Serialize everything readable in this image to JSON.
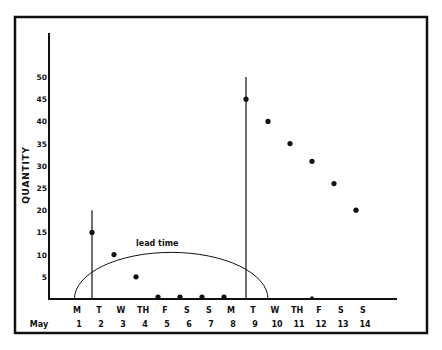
{
  "chart_data": {
    "type": "scatter",
    "title": "",
    "xlabel": "",
    "ylabel": "QUANTITY",
    "ylim": [
      0,
      50
    ],
    "yticks": [
      5,
      10,
      15,
      20,
      25,
      30,
      35,
      40,
      45,
      50
    ],
    "grid": false,
    "legend": null,
    "x_row_label": "May",
    "categories": [
      {
        "day": "M",
        "date": "1"
      },
      {
        "day": "T",
        "date": "2"
      },
      {
        "day": "W",
        "date": "3"
      },
      {
        "day": "TH",
        "date": "4"
      },
      {
        "day": "F",
        "date": "5"
      },
      {
        "day": "S",
        "date": "6"
      },
      {
        "day": "S",
        "date": "7"
      },
      {
        "day": "M",
        "date": "8"
      },
      {
        "day": "T",
        "date": "9"
      },
      {
        "day": "W",
        "date": "10"
      },
      {
        "day": "TH",
        "date": "11"
      },
      {
        "day": "F",
        "date": "12"
      },
      {
        "day": "S",
        "date": "13"
      },
      {
        "day": "S",
        "date": "14"
      }
    ],
    "series": [
      {
        "name": "inventory quantity",
        "points": [
          {
            "x": "2",
            "y": 15
          },
          {
            "x": "3",
            "y": 10
          },
          {
            "x": "4",
            "y": 5
          },
          {
            "x": "5",
            "y": 0
          },
          {
            "x": "6",
            "y": 0
          },
          {
            "x": "7",
            "y": 0
          },
          {
            "x": "8",
            "y": 0
          },
          {
            "x": "9",
            "y": 45
          },
          {
            "x": "10",
            "y": 40
          },
          {
            "x": "11",
            "y": 35
          },
          {
            "x": "12",
            "y": 31
          },
          {
            "x": "13",
            "y": 26
          },
          {
            "x": "14",
            "y": 20
          }
        ]
      }
    ],
    "baseline_markers": [
      {
        "x": "12",
        "y": 0
      }
    ],
    "order_lines": [
      {
        "x": "2",
        "y": 20
      },
      {
        "x": "9",
        "y": 50
      }
    ],
    "annotations": [
      {
        "type": "arc",
        "text": "lead time",
        "x_start": 1.2,
        "x_end": 10.0,
        "peak": 10.5
      }
    ]
  }
}
